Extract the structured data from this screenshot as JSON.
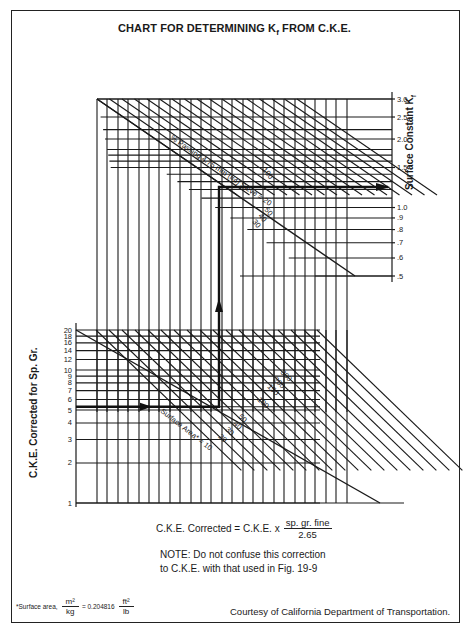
{
  "chart_data": {
    "type": "nomograph",
    "title": "CHART FOR DETERMINING Kf FROM C.K.E.",
    "title_parts": {
      "prefix": "CHART FOR DETERMINING K",
      "subscript": "f",
      "suffix": " FROM C.K.E."
    },
    "right_axis": {
      "label": "Surface Constant Kf",
      "label_main": "Surface Constant K",
      "label_sub": "f",
      "ticks": [
        "3.0",
        "2.5",
        "2.0",
        "1.5",
        "1.0",
        ".9",
        ".8",
        ".7",
        ".6",
        ".5"
      ],
      "tick_values": [
        3.0,
        2.5,
        2.0,
        1.5,
        1.0,
        0.9,
        0.8,
        0.7,
        0.6,
        0.5
      ],
      "scale": "log"
    },
    "left_axis": {
      "label": "C.K.E. Corrected for Sp. Gr.",
      "ticks": [
        "20",
        "18",
        "16",
        "14",
        "12",
        "10",
        "9",
        "8",
        "7",
        "6",
        "5",
        "4",
        "3",
        "2",
        "1"
      ],
      "tick_values": [
        20,
        18,
        16,
        14,
        12,
        10,
        9,
        8,
        7,
        6,
        5,
        4,
        3,
        2,
        1
      ],
      "scale": "log"
    },
    "upper_curves": {
      "parameter": "% Passing 4.75 mm (#4) Sieve",
      "label": "% Passing 4.75 mm (#4) Sieve = 20",
      "values": [
        "20",
        "30",
        "40",
        "50",
        "100"
      ]
    },
    "lower_curves": {
      "parameter": "Surface Area*",
      "label": "Surface Area* = 10",
      "values": [
        "10",
        "20",
        "30",
        "40",
        "50",
        "100",
        "150",
        "200",
        "300"
      ]
    },
    "example_path": {
      "start_cke": 5.3,
      "turn_at_surface_area": 40,
      "turn_at_percent_passing": 40,
      "result_kf": 1.3
    },
    "grid": true
  },
  "formula": {
    "lhs": "C.K.E. Corrected = C.K.E. x",
    "numerator": "sp. gr. fine",
    "denominator": "2.65"
  },
  "note": {
    "line1": "NOTE:  Do not confuse this correction",
    "line2": "to C.K.E. with that used in Fig. 19-9"
  },
  "footnote": {
    "prefix": "*Surface area,",
    "frac1_num": "m²",
    "frac1_den": "kg",
    "equals": "= 0.204816",
    "frac2_num": "ft²",
    "frac2_den": "lb"
  },
  "credit": "Courtesy of California Department of Transportation."
}
